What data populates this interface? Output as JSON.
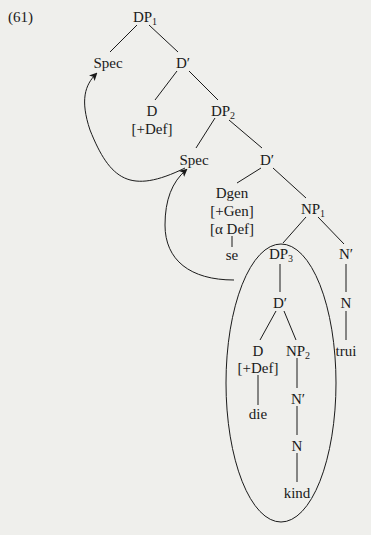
{
  "example_number": "(61)",
  "nodes": {
    "dp1": {
      "base": "DP",
      "sub": "1"
    },
    "spec1": "Spec",
    "dbar1": "D′",
    "d1": "D",
    "d1_feat": "[+Def]",
    "dp2": {
      "base": "DP",
      "sub": "2"
    },
    "spec2": "Spec",
    "dbar2": "D′",
    "dgen": "Dgen",
    "dgen_feat1": "[+Gen]",
    "dgen_feat2": "[α Def]",
    "se": "se",
    "np1": {
      "base": "NP",
      "sub": "1"
    },
    "dp3": {
      "base": "DP",
      "sub": "3"
    },
    "nbar1": "N′",
    "dbar3": "D′",
    "n1": "N",
    "d3": "D",
    "d3_feat": "[+Def]",
    "np2": {
      "base": "NP",
      "sub": "2"
    },
    "trui": "trui",
    "die": "die",
    "nbar2": "N′",
    "n2": "N",
    "kind": "kind"
  }
}
